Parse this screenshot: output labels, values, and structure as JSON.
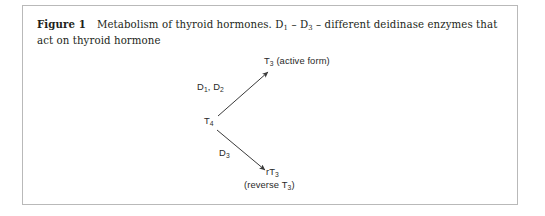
{
  "figure": {
    "label": "Figure 1",
    "caption_text": "Metabolism of thyroid hormones. D1 – D3 – different deidinase enzymes that act on thyroid hormone",
    "caption_part_1": "Metabolism of thyroid hormones. D",
    "caption_sub_1": "1",
    "caption_part_2": " – D",
    "caption_sub_2": "3",
    "caption_part_3": " – different deidinase enzymes that act on thyroid hormone",
    "border_color": "#b9b9b9",
    "text_color": "#231f20"
  },
  "diagram": {
    "type": "flow",
    "ink_color": "#3a3a3a",
    "nodes": [
      {
        "id": "t4",
        "text_main": "T",
        "text_sub": "4",
        "full_text": "T4",
        "x": 181,
        "y": 69
      },
      {
        "id": "t3",
        "text_main": "T",
        "text_sub": "3",
        "text_suffix": " (active form)",
        "full_text": "T3 (active form)",
        "x": 241,
        "y": 9
      },
      {
        "id": "rt3",
        "text_main": "rT",
        "text_sub": "3",
        "full_text": "rT3",
        "x": 243,
        "y": 120
      },
      {
        "id": "rt3_note",
        "text_prefix": "(reverse T",
        "text_sub": "3",
        "text_suffix": ")",
        "full_text": "(reverse T3)",
        "x": 221,
        "y": 133
      }
    ],
    "edges": [
      {
        "id": "t4-to-t3",
        "from": "t4",
        "to": "t3",
        "label_main_1": "D",
        "label_sub_1": "1",
        "label_sep": ", D",
        "label_sub_2": "2",
        "label_full": "D1, D2",
        "label_x": 174,
        "label_y": 35
      },
      {
        "id": "t4-to-rt3",
        "from": "t4",
        "to": "rt3",
        "label_main_1": "D",
        "label_sub_1": "3",
        "label_full": "D3",
        "label_x": 196,
        "label_y": 101
      }
    ]
  }
}
